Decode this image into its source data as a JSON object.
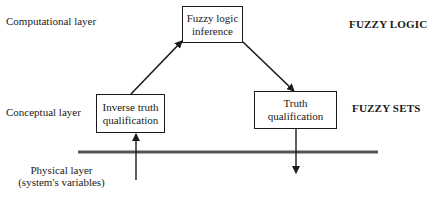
{
  "layers": {
    "computational": "Computational layer",
    "conceptual": "Conceptual layer",
    "physical_line1": "Physical layer",
    "physical_line2": "(system's variables)"
  },
  "categories": {
    "top": "FUZZY LOGIC",
    "middle": "FUZZY SETS"
  },
  "boxes": {
    "inference": {
      "line1": "Fuzzy logic",
      "line2": "inference"
    },
    "inverse": {
      "line1": "Inverse truth",
      "line2": "qualification"
    },
    "truth": {
      "line1": "Truth",
      "line2": "qualification"
    }
  },
  "colors": {
    "ink": "#1a1a1a",
    "divider": "#555555"
  }
}
